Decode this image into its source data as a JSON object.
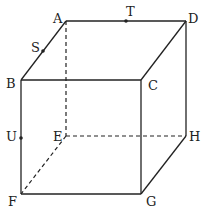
{
  "diagram": {
    "vertices": {
      "A": "A",
      "B": "B",
      "C": "C",
      "D": "D",
      "E": "E",
      "F": "F",
      "G": "G",
      "H": "H"
    },
    "points": {
      "S": {
        "label": "S",
        "on_edge": "AB"
      },
      "T": {
        "label": "T",
        "on_edge": "AD"
      },
      "U": {
        "label": "U",
        "on_edge": "BF"
      }
    },
    "visible_edges": [
      "AD",
      "AB",
      "BC",
      "CD",
      "BF",
      "CG",
      "DH",
      "FG",
      "GH"
    ],
    "hidden_edges": [
      "AE",
      "EF",
      "EH"
    ]
  }
}
